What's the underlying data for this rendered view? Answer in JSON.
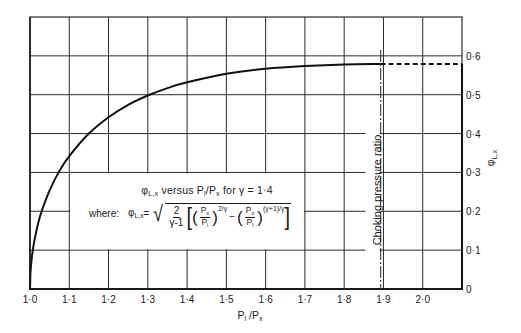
{
  "chart_data": {
    "type": "line",
    "title": "φL,x versus Pl/Px for γ = 1·4",
    "xlabel": "Pl / Px",
    "ylabel": "φL,x",
    "xlim": [
      1.0,
      2.1
    ],
    "ylim": [
      0,
      0.7
    ],
    "grid": true,
    "legend_position": "none",
    "y_axis_side": "right",
    "x_ticks": [
      {
        "value": 1.0,
        "label": "1·0"
      },
      {
        "value": 1.1,
        "label": "1·1"
      },
      {
        "value": 1.2,
        "label": "1·2"
      },
      {
        "value": 1.3,
        "label": "1·3"
      },
      {
        "value": 1.4,
        "label": "1·4"
      },
      {
        "value": 1.5,
        "label": "1·5"
      },
      {
        "value": 1.6,
        "label": "1·6"
      },
      {
        "value": 1.7,
        "label": "1·7"
      },
      {
        "value": 1.8,
        "label": "1·8"
      },
      {
        "value": 1.9,
        "label": "1·9"
      },
      {
        "value": 2.0,
        "label": "2·0"
      }
    ],
    "y_ticks": [
      {
        "value": 0.0,
        "label": "0"
      },
      {
        "value": 0.1,
        "label": "0·1"
      },
      {
        "value": 0.2,
        "label": "0·2"
      },
      {
        "value": 0.3,
        "label": "0·3"
      },
      {
        "value": 0.4,
        "label": "0·4"
      },
      {
        "value": 0.5,
        "label": "0·5"
      },
      {
        "value": 0.6,
        "label": "0·6"
      }
    ],
    "series": [
      {
        "name": "φL,x (γ = 1·4)",
        "style": "solid",
        "x": [
          1.0,
          1.001,
          1.002,
          1.005,
          1.01,
          1.02,
          1.03,
          1.05,
          1.075,
          1.1,
          1.15,
          1.2,
          1.25,
          1.3,
          1.35,
          1.4,
          1.5,
          1.6,
          1.7,
          1.8,
          1.893
        ],
        "y": [
          0.0,
          0.038,
          0.053,
          0.084,
          0.118,
          0.166,
          0.201,
          0.254,
          0.304,
          0.342,
          0.4,
          0.442,
          0.474,
          0.498,
          0.517,
          0.532,
          0.554,
          0.567,
          0.574,
          0.578,
          0.579
        ]
      },
      {
        "name": "φL,x beyond choking (constant)",
        "style": "dashed",
        "x": [
          1.893,
          2.1
        ],
        "y": [
          0.579,
          0.579
        ]
      }
    ],
    "annotations": [
      {
        "type": "vline",
        "x": 1.893,
        "style": "dash-dot",
        "label": "Choking pressure ratio"
      }
    ],
    "formula_text": "φL,x = sqrt( 2/(γ-1) [ (Px/Pl)^(2/γ) − (Px/Pl)^((γ+1)/γ) ] )"
  },
  "labels": {
    "title": {
      "phi": "φ",
      "phi_sub": "L,x",
      "mid": " versus P",
      "p1_sub": "l",
      "slash": "/P",
      "p2_sub": "x",
      "tail": " for γ = 1·4"
    },
    "formula": {
      "where": "where:",
      "phi": "φ",
      "phi_sub": "L,x",
      "eq": " =",
      "frac_num": "2",
      "frac_den": "γ-1",
      "lbracket": "[",
      "rbracket": "]",
      "lparen": "(",
      "rparen": ")",
      "p": "P",
      "px_sub": "x",
      "pl_sub": "l",
      "exp1": "2/γ",
      "minus": "−",
      "exp2": "(γ+1)/γ"
    },
    "x_axis": {
      "p1": "P",
      "p1_sub": "l",
      "slash": " /P",
      "p2_sub": "x"
    },
    "y_axis": {
      "phi": "φ",
      "phi_sub": "L,x"
    },
    "choking": "Choking pressure ratio"
  }
}
